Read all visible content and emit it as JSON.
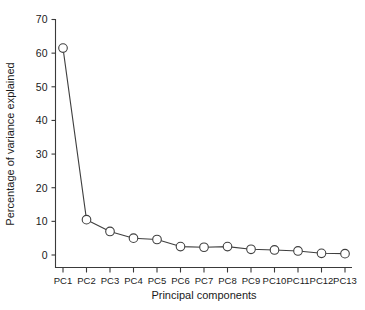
{
  "chart_data": {
    "type": "line",
    "title": "",
    "subtitle": "",
    "xlabel": "Principal components",
    "ylabel": "Percentage of variance explained",
    "categories": [
      "PC1",
      "PC2",
      "PC3",
      "PC4",
      "PC5",
      "PC6",
      "PC7",
      "PC8",
      "PC9",
      "PC10",
      "PC11",
      "PC12",
      "PC13"
    ],
    "values": [
      61.5,
      10.5,
      7.0,
      5.0,
      4.6,
      2.5,
      2.3,
      2.5,
      1.7,
      1.5,
      1.2,
      0.5,
      0.4
    ],
    "series": [
      {
        "name": "Percentage of variance explained",
        "values": [
          61.5,
          10.5,
          7.0,
          5.0,
          4.6,
          2.5,
          2.3,
          2.5,
          1.7,
          1.5,
          1.2,
          0.5,
          0.4
        ]
      }
    ],
    "ylim": [
      0,
      70
    ],
    "yticks": [
      0,
      10,
      20,
      30,
      40,
      50,
      60,
      70
    ],
    "ytick_labels": [
      "0",
      "10",
      "20",
      "30",
      "40",
      "50",
      "60",
      "70"
    ],
    "xtick_labels": [
      "PC1",
      "PC2",
      "PC3",
      "PC4",
      "PC5",
      "PC6",
      "PC7",
      "PC8",
      "PC9",
      "PC10",
      "PC11",
      "PC12",
      "PC13"
    ],
    "grid": false,
    "legend": false,
    "legend_position": "none",
    "marker": "open-circle",
    "line_color": "#3f3f3f",
    "marker_fill": "#ffffff",
    "marker_edge_color": "#3f3f3f",
    "background_color": "#ffffff",
    "axis_color": "#3a3a3a",
    "annotations": []
  }
}
